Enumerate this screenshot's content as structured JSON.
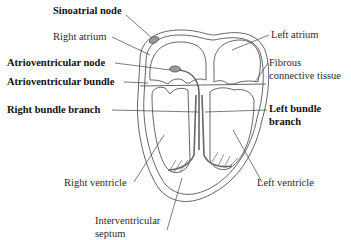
{
  "figure": {
    "colors": {
      "outline": "#555555",
      "leader": "#444444",
      "node_fill": "#999999",
      "text": "#222222",
      "background": "#ffffff"
    }
  },
  "labels": {
    "sinoatrial_node": "Sinoatrial node",
    "right_atrium": "Right atrium",
    "atrioventricular_node": "Atrioventricular node",
    "atrioventricular_bundle": "Atrioventricular bundle",
    "right_bundle_branch": "Right bundle branch",
    "left_atrium": "Left atrium",
    "fibrous_line1": "Fibrous",
    "fibrous_line2": "connective tissue",
    "left_bundle_line1": "Left bundle",
    "left_bundle_line2": "branch",
    "right_ventricle": "Right ventricle",
    "left_ventricle": "Left ventricle",
    "interventricular_line1": "Interventricular",
    "interventricular_line2": "septum"
  },
  "bold_labels": [
    "Sinoatrial node",
    "Atrioventricular node",
    "Atrioventricular bundle",
    "Right bundle branch",
    "Left bundle branch"
  ]
}
